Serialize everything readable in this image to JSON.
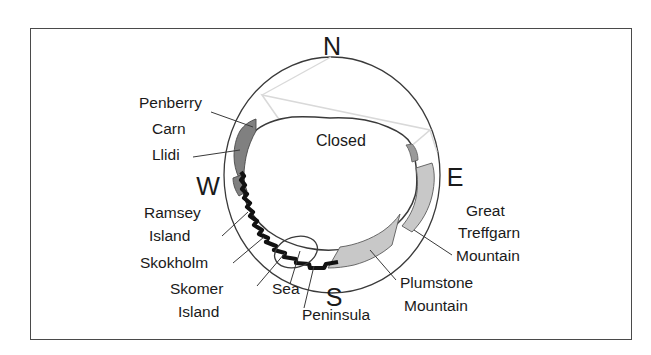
{
  "figure": {
    "kind": "panorama-viewshed-diagram",
    "frame_border_color": "#4a4a4a",
    "background_color": "#ffffff",
    "line_color": "#3a3a3a",
    "text_color": "#1a1a1a"
  },
  "compass": {
    "north": "N",
    "west": "W",
    "east": "E",
    "south": "S"
  },
  "regions": {
    "closed": {
      "label": "Closed",
      "outline_color": "#d9d9d9"
    },
    "dark_patch_color": "#808080",
    "light_patch_color": "#c8c8c8",
    "coastline_color": "#121212"
  },
  "labels": [
    {
      "id": "penberry",
      "text": "Penberry",
      "x": 139,
      "y": 108,
      "anchor": "start"
    },
    {
      "id": "carn",
      "text": "Carn",
      "x": 152,
      "y": 134,
      "anchor": "start"
    },
    {
      "id": "llidi",
      "text": "Llidi",
      "x": 152,
      "y": 160,
      "anchor": "start"
    },
    {
      "id": "ramsey",
      "text": "Ramsey",
      "x": 144,
      "y": 218,
      "anchor": "start"
    },
    {
      "id": "island-ramsey",
      "text": "Island",
      "x": 149,
      "y": 241,
      "anchor": "start"
    },
    {
      "id": "skokholm",
      "text": "Skokholm",
      "x": 140,
      "y": 268,
      "anchor": "start"
    },
    {
      "id": "skomer",
      "text": "Skomer",
      "x": 170,
      "y": 294,
      "anchor": "start"
    },
    {
      "id": "island-skomer",
      "text": "Island",
      "x": 178,
      "y": 317,
      "anchor": "start"
    },
    {
      "id": "sea",
      "text": "Sea",
      "x": 272,
      "y": 294,
      "anchor": "start"
    },
    {
      "id": "peninsula",
      "text": "Peninsula",
      "x": 302,
      "y": 320,
      "anchor": "start"
    },
    {
      "id": "great",
      "text": "Great",
      "x": 466,
      "y": 216,
      "anchor": "start"
    },
    {
      "id": "treffgarn",
      "text": "Treffgarn",
      "x": 458,
      "y": 238,
      "anchor": "start"
    },
    {
      "id": "mountain-treffgarn",
      "text": "Mountain",
      "x": 456,
      "y": 261,
      "anchor": "start"
    },
    {
      "id": "plumstone",
      "text": "Plumstone",
      "x": 400,
      "y": 288,
      "anchor": "start"
    },
    {
      "id": "mountain-plumstone",
      "text": "Mountain",
      "x": 404,
      "y": 311,
      "anchor": "start"
    }
  ]
}
